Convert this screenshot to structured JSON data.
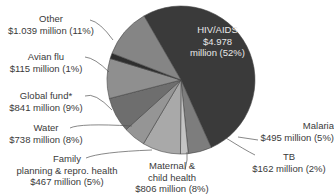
{
  "chart_data": {
    "type": "pie",
    "title": "",
    "unit": "million USD",
    "slices": [
      {
        "label": "HIV/AIDS",
        "value_text": "$4.978 million (52%)",
        "value": 4978,
        "percent": 52,
        "color": "#3a3a3a"
      },
      {
        "label": "Malaria",
        "value_text": "$495 million (5%)",
        "value": 495,
        "percent": 5,
        "color": "#7d7d7d"
      },
      {
        "label": "TB",
        "value_text": "$162 million (2%)",
        "value": 162,
        "percent": 2,
        "color": "#c4c4c4"
      },
      {
        "label": "Maternal & child health",
        "value_text": "$806 million (8%)",
        "value": 806,
        "percent": 8,
        "color": "#a9a9a9"
      },
      {
        "label": "Family planning & repro. health",
        "value_text": "$467 million (5%)",
        "value": 467,
        "percent": 5,
        "color": "#959595"
      },
      {
        "label": "Water",
        "value_text": "$738 million (8%)",
        "value": 738,
        "percent": 8,
        "color": "#6e6e6e"
      },
      {
        "label": "Global fund*",
        "value_text": "$841 million (9%)",
        "value": 841,
        "percent": 9,
        "color": "#8f8f8f"
      },
      {
        "label": "Avian flu",
        "value_text": "$115 million (1%)",
        "value": 115,
        "percent": 1,
        "color": "#2e2e2e"
      },
      {
        "label": "Other",
        "value_text": "$1.039 million (11%)",
        "value": 1039,
        "percent": 11,
        "color": "#858585"
      }
    ]
  },
  "labels": {
    "hiv": {
      "name": "HIV/AIDS",
      "line1": "$4.978",
      "line2": "million (52%)"
    },
    "malaria": {
      "name": "Malaria",
      "value": "$495 million (5%)"
    },
    "tb": {
      "name": "TB",
      "value": "$162 million (2%)"
    },
    "maternal": {
      "line1": "Maternal &",
      "line2": "child health",
      "value": "$806 million (8%)"
    },
    "family": {
      "line1": "Family",
      "line2": "planning & repro. health",
      "value": "$467 million (5%)"
    },
    "water": {
      "name": "Water",
      "value": "$738 million (8%)"
    },
    "global": {
      "name": "Global fund*",
      "value": "$841 million (9%)"
    },
    "avian": {
      "name": "Avian flu",
      "value": "$115 million (1%)"
    },
    "other": {
      "name": "Other",
      "value": "$1.039 million (11%)"
    }
  }
}
